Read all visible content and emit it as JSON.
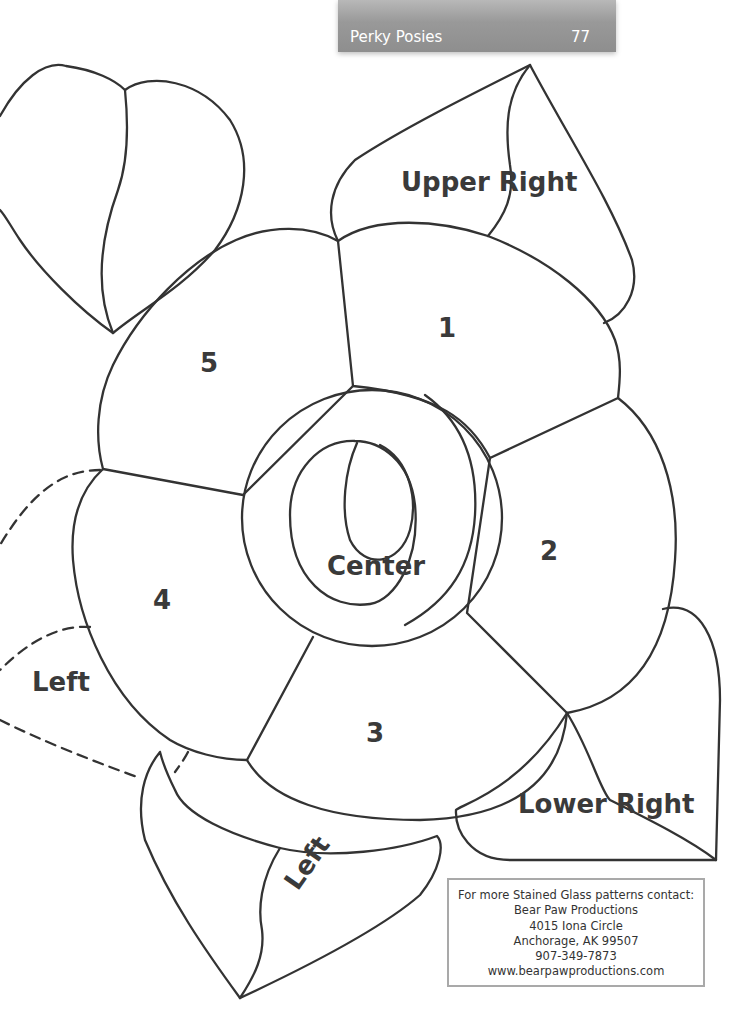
{
  "header": {
    "title": "Perky Posies",
    "page_number": "77",
    "bar_color": "#999999"
  },
  "pattern": {
    "line_color": "#333333",
    "labels": {
      "upper_right": "Upper Right",
      "petal_1": "1",
      "petal_2": "2",
      "petal_3": "3",
      "petal_4": "4",
      "petal_5": "5",
      "center": "Center",
      "left_dashed": "Left",
      "left_leaf": "Left",
      "lower_right": "Lower Right"
    }
  },
  "contact": {
    "lines": [
      "For more Stained Glass patterns contact:",
      "Bear Paw Productions",
      "4015 Iona Circle",
      "Anchorage, AK 99507",
      "907-349-7873",
      "www.bearpawproductions.com"
    ],
    "border_color": "#a9a9a9"
  }
}
